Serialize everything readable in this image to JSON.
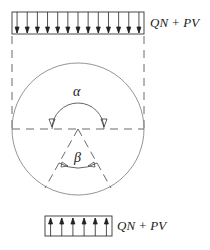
{
  "diagram": {
    "top_load": {
      "label": "QN + PV",
      "arrow_count": 13,
      "direction": "down"
    },
    "bottom_load": {
      "label": "QN + PV",
      "arrow_count": 6,
      "direction": "up"
    },
    "angles": {
      "upper": "α",
      "lower": "β"
    },
    "colors": {
      "stroke": "#333333",
      "circle": "#888888",
      "background": "#ffffff"
    }
  }
}
